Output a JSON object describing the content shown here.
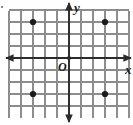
{
  "figure": {
    "type": "coordinate-grid",
    "title": "",
    "labels": {
      "x_axis": "x",
      "y_axis": "y",
      "origin": "O"
    },
    "colors": {
      "grid": "#8d8d8d",
      "axis": "#2b2b2b",
      "point": "#1a1a1a",
      "background": "#ffffff"
    }
  },
  "chart_data": {
    "type": "scatter",
    "title": "",
    "xlabel": "x",
    "ylabel": "y",
    "origin_label": "O",
    "grid": true,
    "legend": null,
    "xlim": [
      -5,
      5
    ],
    "ylim": [
      -4,
      5
    ],
    "xticks": [
      -5,
      -4,
      -3,
      -2,
      -1,
      0,
      1,
      2,
      3,
      4,
      5
    ],
    "yticks": [
      -4,
      -3,
      -2,
      -1,
      0,
      1,
      2,
      3,
      4,
      5
    ],
    "tick_labels_shown": false,
    "grid_spacing": 1,
    "points": [
      {
        "label": "A",
        "x": -3,
        "y": 3
      },
      {
        "label": "B",
        "x": 3,
        "y": 3
      },
      {
        "label": "C",
        "x": -3,
        "y": -3
      },
      {
        "label": "D",
        "x": 3,
        "y": -3
      }
    ],
    "series": [
      {
        "name": "plotted points",
        "x": [
          -3,
          3,
          -3,
          3
        ],
        "y": [
          3,
          3,
          -3,
          -3
        ]
      }
    ]
  },
  "geometry": {
    "px_origin_x": 69,
    "px_origin_y": 58,
    "px_step": 12,
    "px_grid_left": 9,
    "px_grid_right": 129,
    "px_grid_top": 11,
    "px_grid_bottom": 118
  }
}
